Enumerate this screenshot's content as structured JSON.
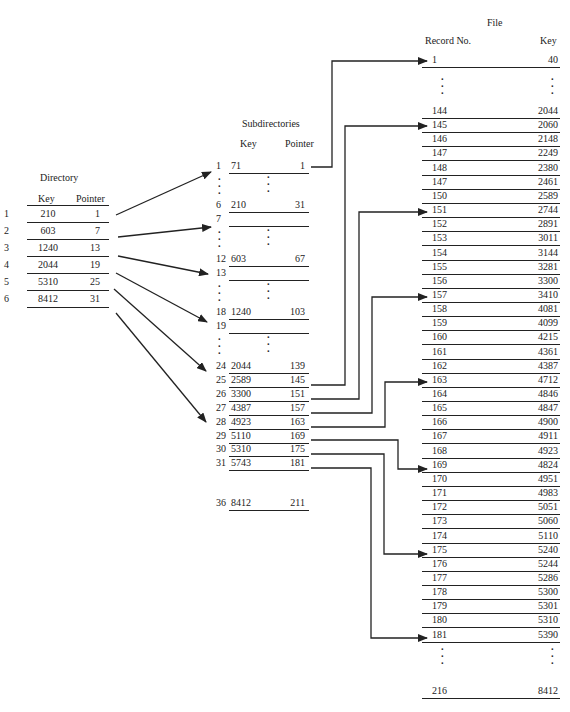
{
  "directory": {
    "title": "Directory",
    "headers": {
      "key": "Key",
      "pointer": "Pointer"
    },
    "rows": [
      {
        "index": "1",
        "key": "210",
        "pointer": "1"
      },
      {
        "index": "2",
        "key": "603",
        "pointer": "7"
      },
      {
        "index": "3",
        "key": "1240",
        "pointer": "13"
      },
      {
        "index": "4",
        "key": "2044",
        "pointer": "19"
      },
      {
        "index": "5",
        "key": "5310",
        "pointer": "25"
      },
      {
        "index": "6",
        "key": "8412",
        "pointer": "31"
      }
    ]
  },
  "subdirectories": {
    "title": "Subdirectories",
    "headers": {
      "key": "Key",
      "pointer": "Pointer"
    },
    "rows": [
      {
        "index": "1",
        "key": "71",
        "pointer": "1"
      },
      {
        "index": "6",
        "key": "210",
        "pointer": "31"
      },
      {
        "index": "7",
        "key": "",
        "pointer": ""
      },
      {
        "index": "12",
        "key": "603",
        "pointer": "67"
      },
      {
        "index": "13",
        "key": "",
        "pointer": ""
      },
      {
        "index": "18",
        "key": "1240",
        "pointer": "103"
      },
      {
        "index": "19",
        "key": "",
        "pointer": ""
      },
      {
        "index": "24",
        "key": "2044",
        "pointer": "139"
      },
      {
        "index": "25",
        "key": "2589",
        "pointer": "145"
      },
      {
        "index": "26",
        "key": "3300",
        "pointer": "151"
      },
      {
        "index": "27",
        "key": "4387",
        "pointer": "157"
      },
      {
        "index": "28",
        "key": "4923",
        "pointer": "163"
      },
      {
        "index": "29",
        "key": "5110",
        "pointer": "169"
      },
      {
        "index": "30",
        "key": "5310",
        "pointer": "175"
      },
      {
        "index": "31",
        "key": "5743",
        "pointer": "181"
      },
      {
        "index": "36",
        "key": "8412",
        "pointer": "211"
      }
    ],
    "ellipsis": "⋮"
  },
  "file": {
    "title": "File",
    "headers": {
      "record": "Record No.",
      "key": "Key"
    },
    "rows": [
      {
        "record": "1",
        "key": "40"
      },
      {
        "record": "144",
        "key": "2044"
      },
      {
        "record": "145",
        "key": "2060"
      },
      {
        "record": "146",
        "key": "2148"
      },
      {
        "record": "147",
        "key": "2249"
      },
      {
        "record": "148",
        "key": "2380"
      },
      {
        "record": "147",
        "key": "2461"
      },
      {
        "record": "150",
        "key": "2589"
      },
      {
        "record": "151",
        "key": "2744"
      },
      {
        "record": "152",
        "key": "2891"
      },
      {
        "record": "153",
        "key": "3011"
      },
      {
        "record": "154",
        "key": "3144"
      },
      {
        "record": "155",
        "key": "3281"
      },
      {
        "record": "156",
        "key": "3300"
      },
      {
        "record": "157",
        "key": "3410"
      },
      {
        "record": "158",
        "key": "4081"
      },
      {
        "record": "159",
        "key": "4099"
      },
      {
        "record": "160",
        "key": "4215"
      },
      {
        "record": "161",
        "key": "4361"
      },
      {
        "record": "162",
        "key": "4387"
      },
      {
        "record": "163",
        "key": "4712"
      },
      {
        "record": "164",
        "key": "4846"
      },
      {
        "record": "165",
        "key": "4847"
      },
      {
        "record": "166",
        "key": "4900"
      },
      {
        "record": "167",
        "key": "4911"
      },
      {
        "record": "168",
        "key": "4923"
      },
      {
        "record": "169",
        "key": "4824"
      },
      {
        "record": "170",
        "key": "4951"
      },
      {
        "record": "171",
        "key": "4983"
      },
      {
        "record": "172",
        "key": "5051"
      },
      {
        "record": "173",
        "key": "5060"
      },
      {
        "record": "174",
        "key": "5110"
      },
      {
        "record": "175",
        "key": "5240"
      },
      {
        "record": "176",
        "key": "5244"
      },
      {
        "record": "177",
        "key": "5286"
      },
      {
        "record": "178",
        "key": "5300"
      },
      {
        "record": "179",
        "key": "5301"
      },
      {
        "record": "180",
        "key": "5310"
      },
      {
        "record": "181",
        "key": "5390"
      },
      {
        "record": "216",
        "key": "8412"
      }
    ],
    "ellipsis": "⋮"
  },
  "arrows": {
    "directory_to_subdirectory": [
      {
        "from": "directory.1",
        "to": "subdirectory.1"
      },
      {
        "from": "directory.2",
        "to": "subdirectory.7"
      },
      {
        "from": "directory.3",
        "to": "subdirectory.13"
      },
      {
        "from": "directory.4",
        "to": "subdirectory.19"
      },
      {
        "from": "directory.5",
        "to": "subdirectory.25"
      },
      {
        "from": "directory.6",
        "to": "subdirectory.31"
      }
    ],
    "subdirectory_to_file": [
      {
        "from": "subdirectory.1",
        "to": "record.1"
      },
      {
        "from": "subdirectory.25",
        "to": "record.145"
      },
      {
        "from": "subdirectory.26",
        "to": "record.151"
      },
      {
        "from": "subdirectory.27",
        "to": "record.157"
      },
      {
        "from": "subdirectory.28",
        "to": "record.163"
      },
      {
        "from": "subdirectory.29",
        "to": "record.169"
      },
      {
        "from": "subdirectory.30",
        "to": "record.175"
      },
      {
        "from": "subdirectory.31",
        "to": "record.181"
      }
    ]
  }
}
